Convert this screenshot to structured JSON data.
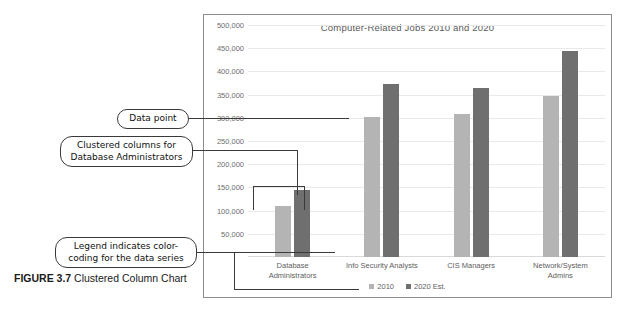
{
  "figure": {
    "label": "FIGURE 3.7",
    "caption": "Clustered Column Chart"
  },
  "chart_data": {
    "type": "bar",
    "title": "Computer-Related Jobs 2010 and 2020",
    "xlabel": "",
    "ylabel": "",
    "ylim": [
      0,
      500000
    ],
    "ytick_step": 50000,
    "grid": true,
    "legend_position": "bottom",
    "ticks": [
      "50,000",
      "100,000",
      "150,000",
      "200,000",
      "250,000",
      "300,000",
      "350,000",
      "400,000",
      "450,000",
      "500,000"
    ],
    "categories": [
      "Database\nAdministrators",
      "Info Security Analysts",
      "CIS Managers",
      "Network/System\nAdmins"
    ],
    "series": [
      {
        "name": "2010",
        "color": "#b4b4b4",
        "values": [
          110000,
          302000,
          308000,
          347000
        ]
      },
      {
        "name": "2020 Est.",
        "color": "#6f6f6f",
        "values": [
          145000,
          372000,
          365000,
          443000
        ]
      }
    ]
  },
  "annotations": [
    {
      "id": "data-point",
      "text": "Data point"
    },
    {
      "id": "clustered-columns",
      "text": "Clustered columns for\nDatabase Administrators"
    },
    {
      "id": "legend-note",
      "text": "Legend indicates color-\ncoding for the data series"
    }
  ]
}
